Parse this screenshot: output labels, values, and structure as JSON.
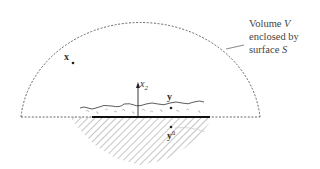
{
  "diagram": {
    "annotation": {
      "line1_prefix": "Volume",
      "line1_var": "V",
      "line2": "enclosed by",
      "line3_prefix": "surface",
      "line3_var": "S"
    },
    "points": {
      "x_label": "x",
      "y_label": "y",
      "y_image_label": "y",
      "y_image_superscript": "ū"
    },
    "axis": {
      "label": "x",
      "subscript": "2"
    },
    "colors": {
      "dashed_boundary": "#555555",
      "surface_line": "#111111",
      "hatch": "#bbbbbb",
      "text": "#333333"
    }
  }
}
